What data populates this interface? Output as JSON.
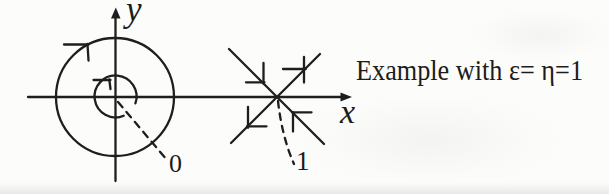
{
  "diagram": {
    "caption": "Example with ε= η=1",
    "labels": {
      "y_axis": "y",
      "x_axis": "x",
      "origin_point": "0",
      "saddle_point": "1"
    },
    "colors": {
      "ink": "#1e1e1e",
      "background": "#fcfcfa"
    }
  }
}
